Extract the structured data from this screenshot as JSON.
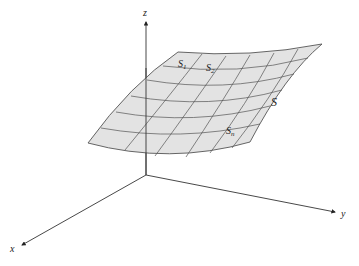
{
  "figure": {
    "axes": {
      "x_label": "x",
      "y_label": "y",
      "z_label": "z"
    },
    "surface_label": "S",
    "patches": {
      "first": {
        "base": "S",
        "sub": "1"
      },
      "second": {
        "base": "S",
        "sub": "2"
      },
      "last": {
        "base": "S",
        "sub": "n"
      }
    },
    "colors": {
      "surface_fill": "#e3e3e3",
      "grid_line": "#555555",
      "axis_line": "#333333"
    }
  }
}
